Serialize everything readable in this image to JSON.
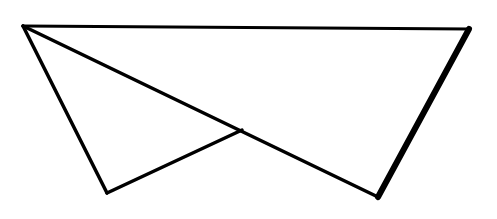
{
  "diagram": {
    "background": "#ffffff",
    "stroke_color": "#000000",
    "vertices": {
      "top_left": [
        23,
        26
      ],
      "top_right": [
        469,
        29
      ],
      "bottom_left": [
        107,
        193
      ],
      "bottom_right": [
        378,
        197
      ],
      "inner_point": [
        242,
        130
      ]
    },
    "segments": [
      {
        "id": "top-edge",
        "from": [
          23,
          26
        ],
        "to": [
          469,
          29
        ],
        "width": 3
      },
      {
        "id": "right-edge",
        "from": [
          469,
          29
        ],
        "to": [
          378,
          197
        ],
        "width": 6
      },
      {
        "id": "long-diagonal",
        "from": [
          23,
          26
        ],
        "to": [
          378,
          197
        ],
        "width": 3.5
      },
      {
        "id": "left-edge",
        "from": [
          23,
          26
        ],
        "to": [
          107,
          193
        ],
        "width": 3.5
      },
      {
        "id": "short-segment",
        "from": [
          107,
          193
        ],
        "to": [
          242,
          130
        ],
        "width": 3.5
      }
    ]
  }
}
